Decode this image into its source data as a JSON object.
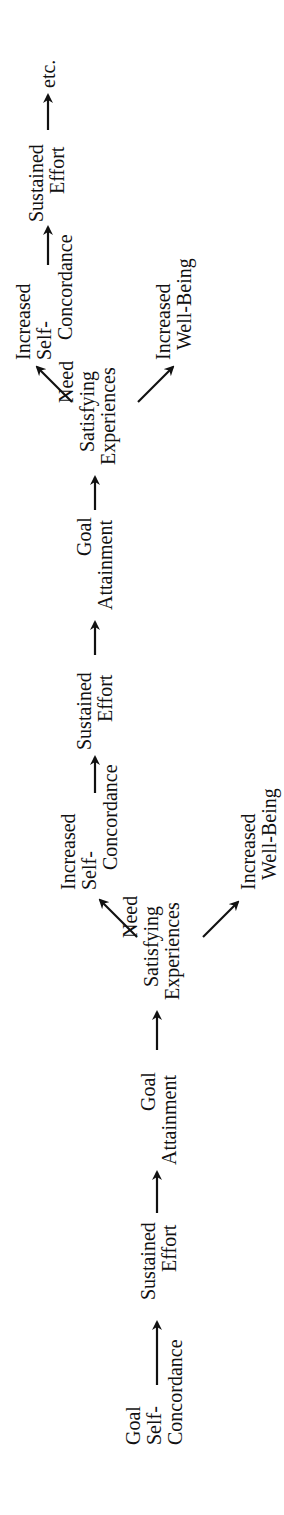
{
  "diagram": {
    "type": "flow",
    "orientation": "rotated-90-ccw",
    "text_color": "#111111",
    "background": "#ffffff",
    "nodes": [
      {
        "id": "goal-self-concordance",
        "lines": [
          "Goal",
          "Self-",
          "Concordance"
        ]
      },
      {
        "id": "sustained-effort-1",
        "lines": [
          "Sustained",
          "Effort"
        ]
      },
      {
        "id": "goal-attainment-1",
        "lines": [
          "Goal",
          "Attainment"
        ]
      },
      {
        "id": "need-satisfying-1",
        "lines": [
          "Need",
          "Satisfying",
          "Experiences"
        ]
      },
      {
        "id": "increased-self-concordance-1",
        "lines": [
          "Increased",
          "Self-",
          "Concordance"
        ]
      },
      {
        "id": "increased-well-being-1",
        "lines": [
          "Increased",
          "Well-Being"
        ]
      },
      {
        "id": "sustained-effort-2",
        "lines": [
          "Sustained",
          "Effort"
        ]
      },
      {
        "id": "goal-attainment-2",
        "lines": [
          "Goal",
          "Attainment"
        ]
      },
      {
        "id": "need-satisfying-2",
        "lines": [
          "Need",
          "Satisfying",
          "Experiences"
        ]
      },
      {
        "id": "increased-self-concordance-2",
        "lines": [
          "Increased",
          "Self-",
          "Concordance"
        ]
      },
      {
        "id": "increased-well-being-2",
        "lines": [
          "Increased",
          "Well-Being"
        ]
      },
      {
        "id": "sustained-effort-3",
        "lines": [
          "Sustained",
          "Effort"
        ]
      },
      {
        "id": "etc",
        "lines": [
          "etc."
        ]
      }
    ],
    "edges": [
      {
        "from": "goal-self-concordance",
        "to": "sustained-effort-1"
      },
      {
        "from": "sustained-effort-1",
        "to": "goal-attainment-1"
      },
      {
        "from": "goal-attainment-1",
        "to": "need-satisfying-1"
      },
      {
        "from": "need-satisfying-1",
        "to": "increased-self-concordance-1"
      },
      {
        "from": "need-satisfying-1",
        "to": "increased-well-being-1"
      },
      {
        "from": "increased-self-concordance-1",
        "to": "sustained-effort-2"
      },
      {
        "from": "sustained-effort-2",
        "to": "goal-attainment-2"
      },
      {
        "from": "goal-attainment-2",
        "to": "need-satisfying-2"
      },
      {
        "from": "need-satisfying-2",
        "to": "increased-self-concordance-2"
      },
      {
        "from": "need-satisfying-2",
        "to": "increased-well-being-2"
      },
      {
        "from": "increased-self-concordance-2",
        "to": "sustained-effort-3"
      },
      {
        "from": "sustained-effort-3",
        "to": "etc"
      }
    ]
  }
}
